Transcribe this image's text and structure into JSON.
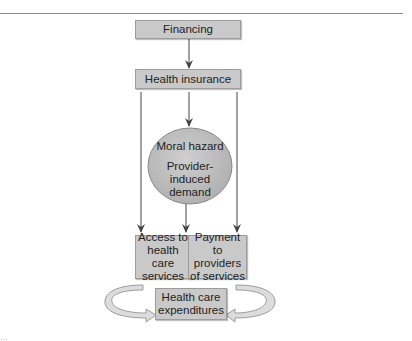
{
  "diagram": {
    "nodes": {
      "financing": "Financing",
      "health_insurance": "Health insurance",
      "oval_line1": "Moral hazard",
      "oval_line2": "Provider-induced demand",
      "access": "Access to health care services",
      "payment": "Payment to providers of services",
      "expenditures": "Health care expenditures"
    },
    "edges": [
      {
        "from": "financing",
        "to": "health_insurance"
      },
      {
        "from": "health_insurance",
        "to": "oval"
      },
      {
        "from": "health_insurance",
        "to": "access"
      },
      {
        "from": "oval",
        "to": "access_payment_boundary"
      },
      {
        "from": "health_insurance",
        "to": "payment"
      },
      {
        "from": "access_payment",
        "to": "expenditures",
        "style": "curved-left"
      },
      {
        "from": "access_payment",
        "to": "expenditures",
        "style": "curved-right"
      }
    ],
    "colors": {
      "box_fill": "#c9c9c9",
      "oval_fill": "#bdbdbd",
      "arrow": "#444444",
      "curved_arrow_fill": "#dcdcdc"
    },
    "caption": "…"
  }
}
